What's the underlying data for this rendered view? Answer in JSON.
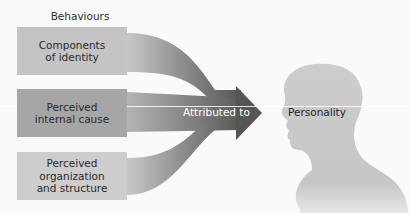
{
  "diagram": {
    "title": "Behaviours",
    "inputs": [
      {
        "label": "Components\nof identity",
        "color": "#c4c4c4"
      },
      {
        "label": "Perceived\ninternal cause",
        "color": "#a6a6a6"
      },
      {
        "label": "Perceived\norganization\nand structure",
        "color": "#cdcdcd"
      }
    ],
    "arrow_label": "Attributed to",
    "target_label": "Personality",
    "icons": {
      "arrow": "merging-arrow-icon",
      "head": "head-silhouette-icon"
    },
    "colors": {
      "arrow_dark": "#5a5a5a",
      "arrow_light": "#c8c8c8",
      "silhouette": "#c9c9c9",
      "background": "#fafafa"
    }
  }
}
